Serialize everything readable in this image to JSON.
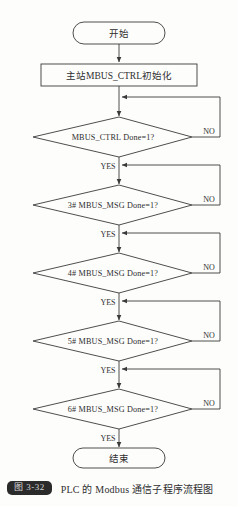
{
  "figure": {
    "caption_badge": "图 3-32",
    "caption_text": "PLC 的 Modbus 通信子程序流程图",
    "line_color": "#3a3a3a",
    "text_color": "#2e2e2e",
    "background": "#fdfdfc",
    "badge_bg": "#2b2b2b",
    "badge_fg": "#d8d8d8"
  },
  "flowchart": {
    "type": "flowchart",
    "start": {
      "label": "开始",
      "shape": "terminator"
    },
    "process": {
      "label": "主站MBUS_CTRL初始化",
      "shape": "rectangle"
    },
    "decisions": [
      {
        "label": "MBUS_CTRL Done=1?",
        "yes": "YES",
        "no": "NO"
      },
      {
        "label": "3# MBUS_MSG Done=1?",
        "yes": "YES",
        "no": "NO"
      },
      {
        "label": "4# MBUS_MSG Done=1?",
        "yes": "YES",
        "no": "NO"
      },
      {
        "label": "5# MBUS_MSG Done=1?",
        "yes": "YES",
        "no": "NO"
      },
      {
        "label": "6# MBUS_MSG Done=1?",
        "yes": "YES",
        "no": "NO"
      }
    ],
    "end": {
      "label": "结束",
      "shape": "terminator"
    }
  }
}
